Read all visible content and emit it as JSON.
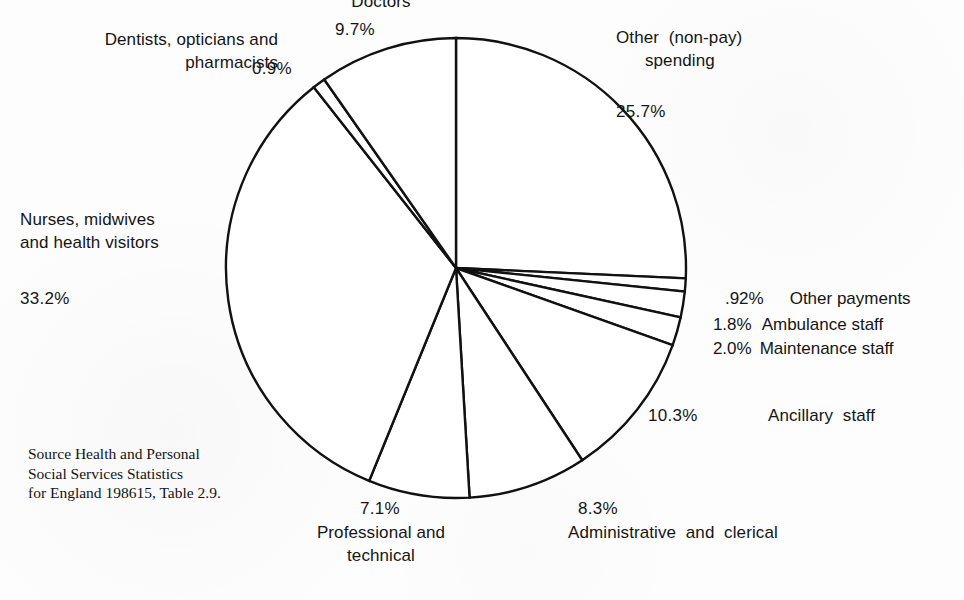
{
  "chart_data": {
    "type": "pie",
    "title": "",
    "units": "percent",
    "start_angle_deg": 0,
    "direction": "clockwise",
    "center": {
      "x": 456,
      "y": 268
    },
    "radius": 230,
    "categories": [
      "Other (non-pay) spending",
      "Other payments",
      "Ambulance staff",
      "Maintenance staff",
      "Ancillary staff",
      "Administrative and clerical",
      "Professional and technical",
      "Nurses, midwives and health visitors",
      "Dentists, opticians and pharmacists",
      "Doctors"
    ],
    "values": [
      25.7,
      0.92,
      1.8,
      2.0,
      10.3,
      8.3,
      7.1,
      33.2,
      0.9,
      9.7
    ],
    "value_labels": [
      "25.7%",
      ".92%",
      "1.8%",
      "2.0%",
      "10.3%",
      "8.3%",
      "7.1%",
      "33.2%",
      "0.9%",
      "9.7%"
    ],
    "legend_position": "around-slices",
    "grid": false,
    "stroke_color": "#111111",
    "fill_color": "#ffffff"
  },
  "slices": {
    "doctors": {
      "label": "Doctors",
      "pct": "9.7%"
    },
    "dentists": {
      "label": "Dentists, opticians and\npharmacists",
      "pct": "0.9%"
    },
    "nurses": {
      "label": "Nurses, midwives\nand health visitors",
      "pct": "33.2%"
    },
    "other_nonpay": {
      "label": "Other  (non-pay)\n      spending",
      "pct": "25.7%"
    },
    "other_pay": {
      "label": "Other payments",
      "pct": ".92%"
    },
    "ambulance": {
      "label": "Ambulance staff",
      "pct": "1.8%"
    },
    "maintenance": {
      "label": "Maintenance staff",
      "pct": "2.0%"
    },
    "ancillary": {
      "label": "Ancillary  staff",
      "pct": "10.3%"
    },
    "admin": {
      "label": "Administrative  and  clerical",
      "pct": "8.3%"
    },
    "professional": {
      "label": "Professional and\ntechnical",
      "pct": "7.1%"
    }
  },
  "source": {
    "note": "Source Health and Personal\nSocial Services Statistics\nfor England 198615, Table 2.9."
  },
  "colors": {
    "background": "#fdfdfd",
    "ink": "#151515",
    "outline": "#111111"
  }
}
